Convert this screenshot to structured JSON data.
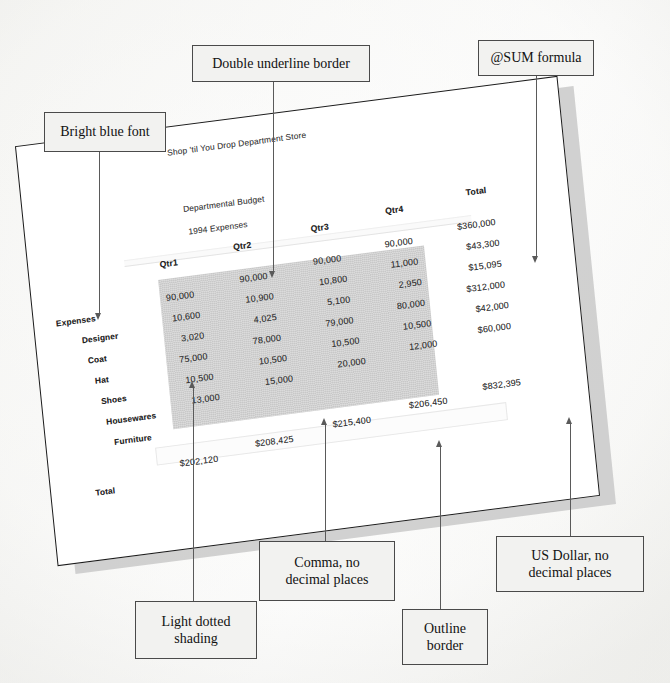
{
  "document": {
    "type": "spreadsheet-printout",
    "title": "Shop 'til You Drop Department Store",
    "subtitle1": "Departmental Budget",
    "subtitle2": "1994 Expenses",
    "section_label": "Expenses",
    "total_row_label": "Total",
    "total_col_label": "Total"
  },
  "spreadsheet": {
    "columns": [
      "Qtr1",
      "Qtr2",
      "Qtr3",
      "Qtr4",
      "Total"
    ],
    "rows": [
      {
        "label": "Designer",
        "qtr1": "90,000",
        "qtr2": "90,000",
        "qtr3": "90,000",
        "qtr4": "90,000",
        "total": "$360,000"
      },
      {
        "label": "Coat",
        "qtr1": "10,600",
        "qtr2": "10,900",
        "qtr3": "10,800",
        "qtr4": "11,000",
        "total": "$43,300"
      },
      {
        "label": "Hat",
        "qtr1": "3,020",
        "qtr2": "4,025",
        "qtr3": "5,100",
        "qtr4": "2,950",
        "total": "$15,095"
      },
      {
        "label": "Shoes",
        "qtr1": "75,000",
        "qtr2": "78,000",
        "qtr3": "79,000",
        "qtr4": "80,000",
        "total": "$312,000"
      },
      {
        "label": "Housewares",
        "qtr1": "10,500",
        "qtr2": "10,500",
        "qtr3": "10,500",
        "qtr4": "10,500",
        "total": "$42,000"
      },
      {
        "label": "Furniture",
        "qtr1": "13,000",
        "qtr2": "15,000",
        "qtr3": "20,000",
        "qtr4": "12,000",
        "total": "$60,000"
      }
    ],
    "totals": {
      "qtr1": "$202,120",
      "qtr2": "$208,425",
      "qtr3": "$215,400",
      "qtr4": "$206,450",
      "grand": "$832,395"
    }
  },
  "callouts": [
    {
      "id": "bright-blue-font",
      "text": "Bright blue font"
    },
    {
      "id": "double-underline",
      "text": "Double underline border"
    },
    {
      "id": "sum-formula",
      "text": "@SUM formula"
    },
    {
      "id": "light-dotted-shading",
      "line1": "Light dotted",
      "line2": "shading"
    },
    {
      "id": "comma-no-decimals",
      "line1": "Comma, no",
      "line2": "decimal places"
    },
    {
      "id": "outline-border",
      "line1": "Outline",
      "line2": "border"
    },
    {
      "id": "us-dollar",
      "line1": "US Dollar, no",
      "line2": "decimal places"
    }
  ],
  "colors": {
    "page_background": "#fdfdfd",
    "sheet_paper": "#ffffff",
    "sheet_border": "#1b1b1b",
    "sheet_shadow": "#c9c9c9",
    "callout_fill": "#f2f2f0",
    "callout_border": "#4a4a4a",
    "shading_block": "#b9b9b9",
    "leader_line": "#5a5a5a",
    "text": "#111111"
  }
}
